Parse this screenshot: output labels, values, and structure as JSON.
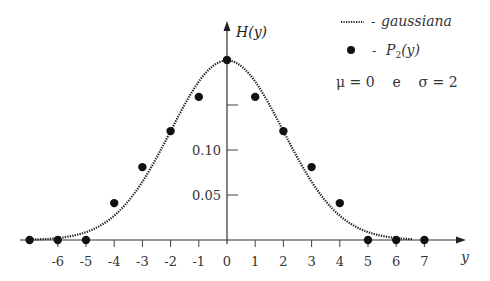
{
  "chart_data": {
    "type": "line",
    "title": "",
    "xlabel": "y",
    "ylabel": "H(y)",
    "xlim": [
      -7,
      7.5
    ],
    "ylim": [
      0,
      0.22
    ],
    "grid": false,
    "x_ticks": [
      "-6",
      "-5",
      "-4",
      "-3",
      "-2",
      "-1",
      "0",
      "1",
      "2",
      "3",
      "4",
      "5",
      "6",
      "7"
    ],
    "y_ticks": [
      {
        "value": 0.05,
        "label": "0.05"
      },
      {
        "value": 0.1,
        "label": "0.10"
      },
      {
        "value": 0.15,
        "label": ""
      }
    ],
    "legend": {
      "position": "upper right",
      "entries": [
        {
          "marker": "dotted-line",
          "label": "gaussiana"
        },
        {
          "marker": "filled-circle",
          "label": "P2(y)"
        }
      ],
      "annotation": "μ = 0   e   σ = 2"
    },
    "series": [
      {
        "name": "gaussiana",
        "style": "dotted",
        "function": "normal_pdf",
        "mu": 0,
        "sigma": 2
      },
      {
        "name": "P2(y)",
        "style": "markers",
        "x": [
          -7,
          -6,
          -5,
          -4,
          -3,
          -2,
          -1,
          0,
          1,
          2,
          3,
          4,
          5,
          6,
          7
        ],
        "values": [
          0.0,
          0.0,
          0.0,
          0.041,
          0.081,
          0.121,
          0.159,
          0.2,
          0.159,
          0.121,
          0.081,
          0.041,
          0.0,
          0.0,
          0.0
        ]
      }
    ]
  },
  "labels": {
    "y_axis": "H(y)",
    "x_axis": "y",
    "legend_gauss_dash": "-",
    "legend_gauss": "gaussiana",
    "legend_p2_dash": "-",
    "legend_p2_main": "P",
    "legend_p2_sub": "2",
    "legend_p2_arg": "(y)",
    "params": "μ = 0    e    σ = 2"
  }
}
